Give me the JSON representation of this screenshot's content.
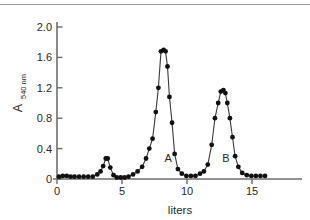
{
  "chart_data": {
    "type": "line",
    "title": "",
    "subtitle": "",
    "xlabel": "liters",
    "ylabel": "A",
    "ylabel_subscript": "540 nm",
    "xlim": [
      0,
      16.8
    ],
    "ylim": [
      0,
      2.18
    ],
    "xticks": [
      0,
      5,
      10,
      15
    ],
    "xticklabels": [
      "0",
      "5",
      "10",
      "15"
    ],
    "yticks": [
      0,
      0.4,
      0.8,
      1.2,
      1.6,
      2.0
    ],
    "yticklabels": [
      "0",
      "0.4",
      "0.8",
      "1.2",
      "1.6",
      "2.0"
    ],
    "grid": false,
    "legend": null,
    "marker": "filled-circle",
    "series": [
      {
        "name": "A540 nm elution profile",
        "x": [
          0.15,
          0.45,
          0.75,
          1.05,
          1.35,
          1.7,
          2.05,
          2.4,
          2.75,
          3.1,
          3.35,
          3.55,
          3.75,
          3.9,
          4.1,
          4.35,
          4.6,
          4.9,
          5.2,
          5.5,
          5.85,
          6.2,
          6.55,
          6.85,
          7.1,
          7.35,
          7.6,
          7.8,
          8.0,
          8.2,
          8.35,
          8.5,
          8.65,
          8.85,
          9.05,
          9.3,
          9.6,
          9.95,
          10.3,
          10.65,
          11.0,
          11.3,
          11.6,
          11.9,
          12.15,
          12.4,
          12.6,
          12.8,
          12.95,
          13.1,
          13.3,
          13.5,
          13.7,
          13.95,
          14.25,
          14.6,
          14.95,
          15.3,
          15.65,
          16.0
        ],
        "y": [
          0.03,
          0.04,
          0.04,
          0.03,
          0.03,
          0.03,
          0.03,
          0.03,
          0.03,
          0.06,
          0.1,
          0.17,
          0.27,
          0.27,
          0.15,
          0.05,
          0.02,
          0.02,
          0.02,
          0.03,
          0.06,
          0.1,
          0.16,
          0.27,
          0.4,
          0.53,
          0.88,
          1.2,
          1.68,
          1.7,
          1.68,
          1.48,
          1.08,
          0.74,
          0.33,
          0.13,
          0.07,
          0.04,
          0.04,
          0.04,
          0.07,
          0.1,
          0.19,
          0.45,
          0.8,
          1.0,
          1.15,
          1.17,
          1.13,
          1.0,
          0.8,
          0.55,
          0.3,
          0.16,
          0.08,
          0.05,
          0.04,
          0.04,
          0.04,
          0.04
        ]
      }
    ],
    "annotations": [
      {
        "text": "A",
        "x": 8.55,
        "y": 0.27
      },
      {
        "text": "B",
        "x": 13.0,
        "y": 0.27
      }
    ]
  },
  "colors": {
    "background": "#ffffff",
    "curve": "#3a3a3a",
    "marker": "#111111",
    "axis": "#6e6e6e",
    "text": "#2a2a2a",
    "top_rule": "#9a9a9a"
  }
}
